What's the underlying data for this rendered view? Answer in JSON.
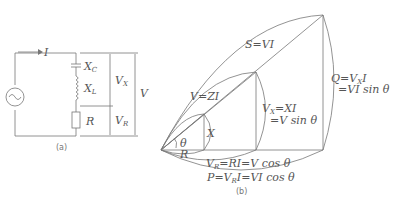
{
  "circuit": {
    "current_label": "→ I",
    "labels": {
      "xc": "X_C",
      "xl": "X_L",
      "r": "R",
      "vx": "V_X",
      "vr": "V_R",
      "v": "V"
    },
    "caption": "(a)"
  },
  "phasor": {
    "caption": "(b)",
    "labels": {
      "s": "S=VI",
      "v": "V=ZI",
      "vx1": "V_X=XI",
      "vx2": "=V sin θ",
      "q1": "Q=V_X I",
      "q2": "=VI sin θ",
      "x": "X",
      "r": "R",
      "theta": "θ",
      "vr": "V_R=RI=V cos θ",
      "p": "P=V_R I=VI cos θ"
    }
  }
}
